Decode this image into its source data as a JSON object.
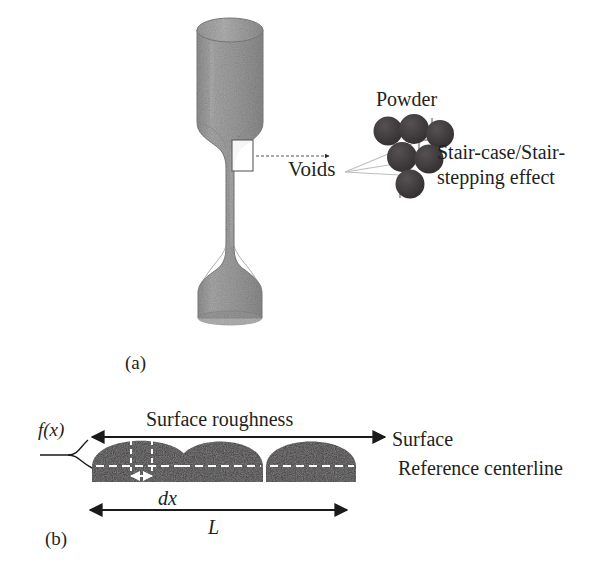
{
  "figure": {
    "panels": [
      {
        "id": "a",
        "label": "(a)"
      },
      {
        "id": "b",
        "label": "(b)"
      }
    ]
  },
  "panel_a": {
    "caption": "(a)",
    "specimen": {
      "name": "tensile-test-specimen",
      "fill_color": "#9a9a9a",
      "edge_color": "#7a7a7a"
    },
    "callout_box": {
      "name": "gauge-inspection-box",
      "stroke": "#5a5a5a"
    },
    "labels": {
      "voids": "Voids",
      "powder": "Powder",
      "stair_line1": "Stair-case/Stair-",
      "stair_line2": "stepping effect"
    },
    "powder_particles": {
      "count": 6,
      "fill_color": "#3d3a3a",
      "rows": [
        3,
        2,
        1
      ]
    },
    "staircase": {
      "name": "stair-step-polyline",
      "stroke": "#a6a6a6"
    }
  },
  "panel_b": {
    "caption": "(b)",
    "labels": {
      "surface_roughness": "Surface roughness",
      "surface": "Surface",
      "reference_centerline": "Reference centerline",
      "fx": "f(x)",
      "dx": "dx",
      "L": "L"
    },
    "bumps": {
      "count": 3,
      "fill_color": "#3a3737",
      "shape": "semicircular-asperity"
    },
    "dashed_centerline_color": "#ffffff",
    "arrow_color": "#1a1a1a"
  }
}
